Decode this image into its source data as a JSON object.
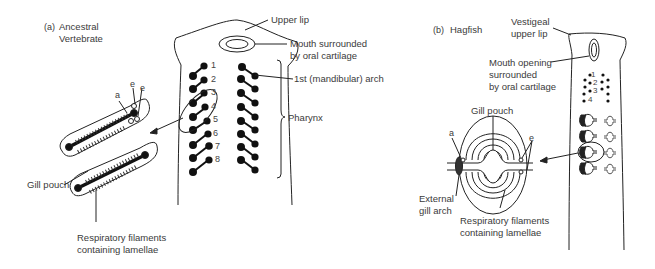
{
  "panel_a": {
    "tag": "(a)",
    "title_line1": "Ancestral",
    "title_line2": "Vertebrate",
    "labels": {
      "upper_lip": "Upper lip",
      "mouth_line1": "Mouth surrounded",
      "mouth_line2": "by oral cartilage",
      "first_arch": "1st (mandibular) arch",
      "pharynx": "Pharynx",
      "gill_pouch": "Gill pouch",
      "resp_line1": "Respiratory filaments",
      "resp_line2": "containing lamellae",
      "a": "a",
      "e1": "e",
      "e2": "e"
    },
    "arch_numbers": [
      "1",
      "2",
      "3",
      "4",
      "5",
      "6",
      "7",
      "8"
    ]
  },
  "panel_b": {
    "tag": "(b)",
    "title": "Hagfish",
    "labels": {
      "upper_lip_line1": "Vestigeal",
      "upper_lip_line2": "upper lip",
      "mouth_line1": "Mouth opening",
      "mouth_line2": "surrounded",
      "mouth_line3": "by oral cartilage",
      "gill_pouch": "Gill pouch",
      "a": "a",
      "e": "e",
      "ext_line1": "External",
      "ext_line2": "gill arch",
      "resp_line1": "Respiratory filaments",
      "resp_line2": "containing lamellae"
    },
    "arch_numbers": [
      "1",
      "2",
      "3",
      "4"
    ]
  }
}
